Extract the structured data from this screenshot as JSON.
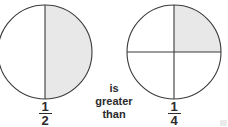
{
  "figure": {
    "background_color": "#ffffff",
    "stroke_color": "#3a3a3a",
    "shade_color": "#e8e8e8",
    "text_color": "#2b2b2b",
    "relation": {
      "line1": "is",
      "line2": "greater",
      "line3": "than"
    },
    "left_model": {
      "name": "half-circle-model",
      "center_x": 45,
      "center_y": 52,
      "radius": 47,
      "total_parts": 2,
      "shaded_parts": 1,
      "divider": "vertical",
      "shaded_region": "right-half",
      "fraction": {
        "numerator": "1",
        "denominator": "2",
        "value": 0.5
      }
    },
    "right_model": {
      "name": "quarter-circle-model",
      "center_x": 174,
      "center_y": 52,
      "radius": 47,
      "total_parts": 4,
      "shaded_parts": 1,
      "divider": "vertical-and-horizontal",
      "shaded_region": "top-right-quadrant",
      "fraction": {
        "numerator": "1",
        "denominator": "4",
        "value": 0.25
      }
    }
  }
}
